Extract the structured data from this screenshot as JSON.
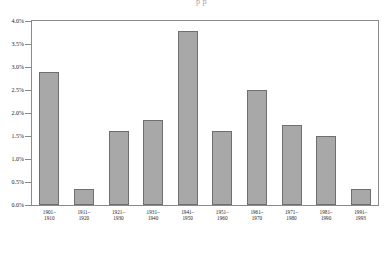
{
  "page_bleed_text": "p    p",
  "chart_data": {
    "type": "bar",
    "title": "",
    "xlabel": "",
    "ylabel": "",
    "ylim": [
      0,
      4.0
    ],
    "grid": false,
    "legend": "none",
    "y_ticks": [
      "0.0%",
      "0.5%",
      "1.0%",
      "1.5%",
      "2.0%",
      "2.5%",
      "3.0%",
      "3.5%",
      "4.0%"
    ],
    "y_tick_values": [
      0.0,
      0.5,
      1.0,
      1.5,
      2.0,
      2.5,
      3.0,
      3.5,
      4.0
    ],
    "categories": [
      "1901–1910",
      "1911–1920",
      "1921–1930",
      "1931–1940",
      "1941–1950",
      "1951–1960",
      "1961–1970",
      "1971–1980",
      "1981–1990",
      "1991–1993"
    ],
    "category_lines": [
      [
        "1901–",
        "1910"
      ],
      [
        "1911–",
        "1920"
      ],
      [
        "1921–",
        "1930"
      ],
      [
        "1931–",
        "1940"
      ],
      [
        "1941–",
        "1950"
      ],
      [
        "1951–",
        "1960"
      ],
      [
        "1961–",
        "1970"
      ],
      [
        "1971–",
        "1980"
      ],
      [
        "1981–",
        "1990"
      ],
      [
        "1991–",
        "1993"
      ]
    ],
    "values": [
      2.9,
      0.35,
      1.6,
      1.85,
      3.78,
      1.6,
      2.5,
      1.75,
      1.5,
      0.35
    ],
    "bar_color": "#a8a8a8",
    "bar_border_color": "#6f6f6f",
    "axis_color": "#8a8a8a"
  }
}
